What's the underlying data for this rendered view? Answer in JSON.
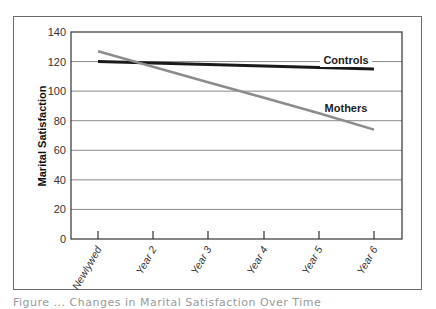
{
  "chart_data": {
    "type": "line",
    "title": "",
    "xlabel": "",
    "ylabel": "Marital Satisfaction",
    "ylim": [
      0,
      140
    ],
    "yticks": [
      0,
      20,
      40,
      60,
      80,
      100,
      120,
      140
    ],
    "grid": true,
    "categories": [
      "Newlywed",
      "Year 2",
      "Year 3",
      "Year 4",
      "Year 5",
      "Year 6"
    ],
    "series": [
      {
        "name": "Controls",
        "color": "#1a1a1a",
        "values": [
          120,
          119,
          118,
          117,
          116,
          115
        ]
      },
      {
        "name": "Mothers",
        "color": "#8c8c8c",
        "values": [
          127,
          116.5,
          106,
          95.5,
          85,
          74
        ]
      }
    ],
    "annotations": [
      {
        "text": "Controls",
        "near_series": "Controls"
      },
      {
        "text": "Mothers",
        "near_series": "Mothers"
      }
    ],
    "legend_position": "inline labels"
  },
  "caption": "Figure ... Changes in Marital Satisfaction Over Time"
}
